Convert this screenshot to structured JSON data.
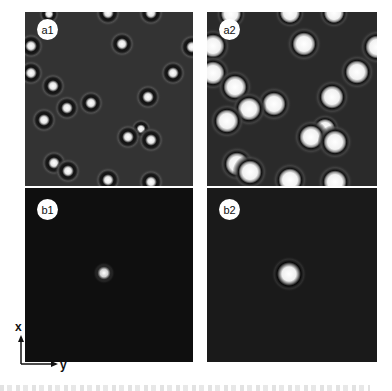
{
  "figure": {
    "panels": [
      {
        "id": "a1",
        "label": "a1",
        "background": "#333333",
        "x": 25,
        "y": 12,
        "width": 168,
        "height": 174,
        "style": "ring",
        "particles": [
          [
            24,
            2,
            4
          ],
          [
            83,
            1,
            5
          ],
          [
            126,
            1,
            5
          ],
          [
            97,
            32,
            5
          ],
          [
            6,
            34,
            5
          ],
          [
            6,
            61,
            5
          ],
          [
            148,
            61,
            5
          ],
          [
            28,
            74,
            5
          ],
          [
            123,
            85,
            5
          ],
          [
            66,
            91,
            5
          ],
          [
            42,
            96,
            5
          ],
          [
            19,
            108,
            5
          ],
          [
            116,
            117,
            4
          ],
          [
            103,
            125,
            5
          ],
          [
            126,
            128,
            5
          ],
          [
            29,
            151,
            5
          ],
          [
            43,
            159,
            5
          ],
          [
            83,
            168,
            5
          ],
          [
            126,
            170,
            5
          ],
          [
            167,
            35,
            5
          ]
        ]
      },
      {
        "id": "a2",
        "label": "a2",
        "background": "#2a2a2a",
        "x": 207,
        "y": 12,
        "width": 170,
        "height": 174,
        "style": "disk",
        "particles": [
          [
            24,
            2,
            7
          ],
          [
            83,
            1,
            7
          ],
          [
            127,
            1,
            7
          ],
          [
            97,
            32,
            8
          ],
          [
            6,
            34,
            8
          ],
          [
            6,
            61,
            8
          ],
          [
            150,
            60,
            8
          ],
          [
            28,
            75,
            8
          ],
          [
            125,
            85,
            8
          ],
          [
            67,
            92,
            8
          ],
          [
            42,
            97,
            8
          ],
          [
            20,
            109,
            8
          ],
          [
            118,
            117,
            7
          ],
          [
            104,
            125,
            8
          ],
          [
            128,
            130,
            8
          ],
          [
            30,
            152,
            8
          ],
          [
            43,
            160,
            8
          ],
          [
            83,
            168,
            8
          ],
          [
            128,
            170,
            8
          ],
          [
            170,
            35,
            8
          ]
        ]
      },
      {
        "id": "b1",
        "label": "b1",
        "background": "#0f0f0f",
        "x": 25,
        "y": 188,
        "width": 168,
        "height": 174,
        "style": "spot-small",
        "particles": [
          [
            79,
            85,
            5
          ]
        ]
      },
      {
        "id": "b2",
        "label": "b2",
        "background": "#1a1a1a",
        "x": 207,
        "y": 188,
        "width": 170,
        "height": 174,
        "style": "spot-large",
        "particles": [
          [
            82,
            86,
            8
          ]
        ]
      }
    ],
    "axes": {
      "vertical": "x",
      "horizontal": "y"
    },
    "caption": ""
  }
}
